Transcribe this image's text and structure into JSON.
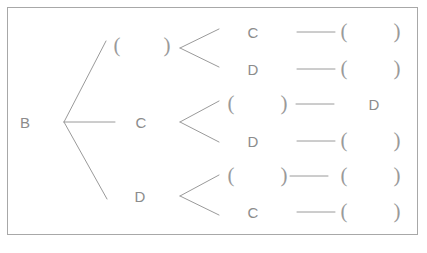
{
  "diagram": {
    "type": "tree",
    "title": "",
    "background_color": "#ffffff",
    "border_color": "#a8a8a8",
    "text_color": "#8c8c8c",
    "line_color": "#9a9a9a",
    "root": {
      "label": "B"
    },
    "level2": [
      {
        "label_left": "(",
        "label_right": ")",
        "label": "(  )"
      },
      {
        "label_left": "",
        "label_right": "",
        "label": "C"
      },
      {
        "label_left": "",
        "label_right": "",
        "label": "D"
      }
    ],
    "level3": [
      {
        "label": "C",
        "dash": "—",
        "tail_left": "(",
        "tail_right": ")"
      },
      {
        "label": "D",
        "dash": "—",
        "tail_left": "(",
        "tail_right": ")"
      },
      {
        "label_left": "(",
        "label_right": ")",
        "dash": "—",
        "tail": "D"
      },
      {
        "label": "D",
        "dash": "—",
        "tail_left": "(",
        "tail_right": ")"
      },
      {
        "label_left": "(",
        "label_right": ")",
        "dash": "—",
        "tail_left": "(",
        "tail_right": ")"
      },
      {
        "label": "C",
        "dash": "—",
        "tail_left": "(",
        "tail_right": ")"
      }
    ],
    "labels": {
      "root_b": "B",
      "branch1_open": "(",
      "branch1_close": ")",
      "branch2_c": "C",
      "branch3_d": "D",
      "row1_c": "C",
      "row1_dash": "—",
      "row1_open": "(",
      "row1_close": ")",
      "row2_d": "D",
      "row2_dash": "—",
      "row2_open": "(",
      "row2_close": ")",
      "row3_open": "(",
      "row3_close": ")",
      "row3_dash": "—",
      "row3_d": "D",
      "row4_d": "D",
      "row4_dash": "—",
      "row4_open": "(",
      "row4_close": ")",
      "row5_open": "(",
      "row5_close": ")",
      "row5_dash": "—",
      "row5_open2": "(",
      "row5_close2": ")",
      "row6_c": "C",
      "row6_dash": "—",
      "row6_open": "(",
      "row6_close": ")"
    }
  }
}
